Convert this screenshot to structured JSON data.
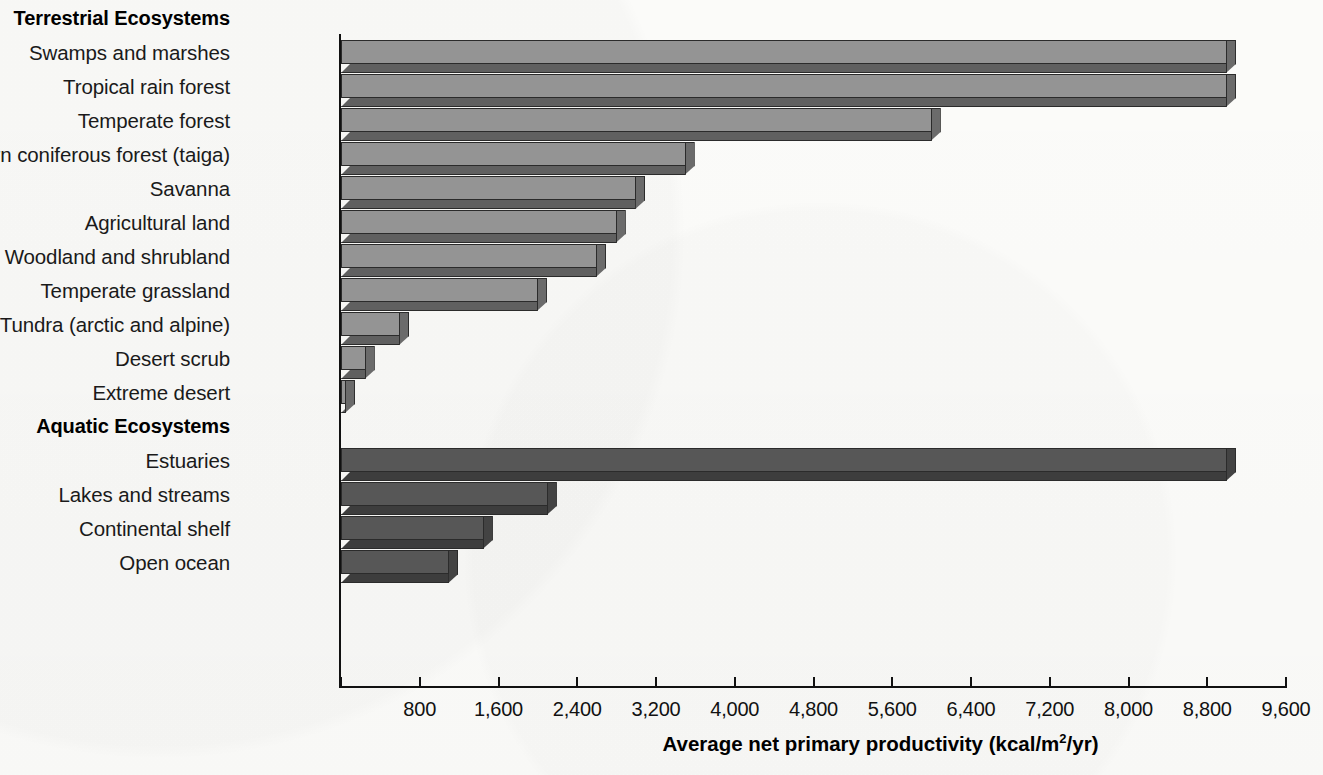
{
  "chart_data": {
    "type": "bar",
    "orientation": "horizontal",
    "title": "",
    "xlabel": "Average net primary productivity (kcal/m²/yr)",
    "ylabel": "",
    "xlim": [
      0,
      9600
    ],
    "xticks": [
      0,
      800,
      1600,
      2400,
      3200,
      4000,
      4800,
      5600,
      6400,
      7200,
      8000,
      8800,
      9600
    ],
    "xticklabels": [
      "",
      "800",
      "1,600",
      "2,400",
      "3,200",
      "4,000",
      "4,800",
      "5,600",
      "6,400",
      "7,200",
      "8,000",
      "8,800",
      "9,600"
    ],
    "grid": false,
    "legend": null,
    "groups": [
      {
        "name": "Terrestrial Ecosystems",
        "color": "#949494",
        "categories": [
          "Swamps and marshes",
          "Tropical rain forest",
          "Temperate forest",
          "Northern coniferous forest (taiga)",
          "Savanna",
          "Agricultural land",
          "Woodland and shrubland",
          "Temperate grassland",
          "Tundra (arctic and alpine)",
          "Desert scrub",
          "Extreme desert"
        ],
        "values": [
          9000,
          9000,
          6000,
          3500,
          3000,
          2800,
          2600,
          2000,
          600,
          250,
          50
        ]
      },
      {
        "name": "Aquatic Ecosystems",
        "color": "#575757",
        "categories": [
          "Estuaries",
          "Lakes and streams",
          "Continental shelf",
          "Open ocean"
        ],
        "values": [
          9000,
          2100,
          1450,
          1100
        ]
      }
    ]
  },
  "axis": {
    "x_title_main": "Average net primary productivity (kcal/m",
    "x_title_sup": "2",
    "x_title_tail": "/yr)"
  },
  "colors": {
    "bar_terrestrial_face": "#949494",
    "bar_terrestrial_depth": "#606060",
    "bar_aquatic_face": "#575757",
    "bar_aquatic_depth": "#3d3d3d",
    "axis": "#111111",
    "background": "#fbfbf9"
  }
}
